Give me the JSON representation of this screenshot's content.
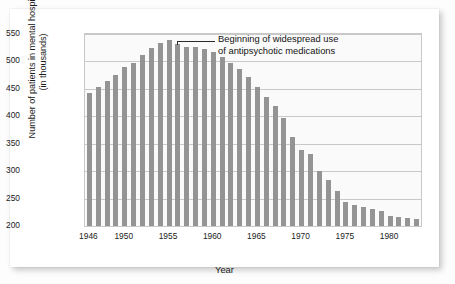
{
  "chart_data": {
    "type": "bar",
    "title": "",
    "xlabel": "Year",
    "ylabel": "Number of patients in mental hospitals\n(in thousands)",
    "ylim": [
      200,
      550
    ],
    "ytick_labels": [
      "200",
      "250",
      "300",
      "350",
      "400",
      "450",
      "500",
      "550"
    ],
    "ytick_values": [
      200,
      250,
      300,
      350,
      400,
      450,
      500,
      550
    ],
    "xtick_labels": [
      "1946",
      "1950",
      "1955",
      "1960",
      "1965",
      "1970",
      "1975",
      "1980"
    ],
    "xtick_values": [
      1946,
      1950,
      1955,
      1960,
      1965,
      1970,
      1975,
      1980
    ],
    "grid": "horizontal",
    "legend": "none",
    "bar_color": "#949494",
    "plot_background": "#fafafa",
    "categories": [
      1946,
      1947,
      1948,
      1949,
      1950,
      1951,
      1952,
      1953,
      1954,
      1955,
      1956,
      1957,
      1958,
      1959,
      1960,
      1961,
      1962,
      1963,
      1964,
      1965,
      1966,
      1967,
      1968,
      1969,
      1970,
      1971,
      1972,
      1973,
      1974,
      1975,
      1976,
      1977,
      1978,
      1979,
      1980,
      1981,
      1982,
      1983
    ],
    "values": [
      442,
      454,
      465,
      476,
      490,
      497,
      511,
      524,
      534,
      539,
      531,
      527,
      526,
      523,
      517,
      508,
      497,
      486,
      471,
      454,
      436,
      419,
      396,
      363,
      338,
      331,
      300,
      284,
      264,
      243,
      239,
      234,
      231,
      228,
      219,
      216,
      214,
      213
    ],
    "annotations": [
      {
        "text": "Beginning of widespread use\nof antipsychotic medications",
        "points_to_year": 1956,
        "points_to_value": 531
      }
    ]
  },
  "annotation": {
    "text": "Beginning of widespread use\nof antipsychotic medications"
  },
  "axes": {
    "xlabel": "Year",
    "ylabel": "Number of patients in mental hospitals\n(in thousands)"
  }
}
